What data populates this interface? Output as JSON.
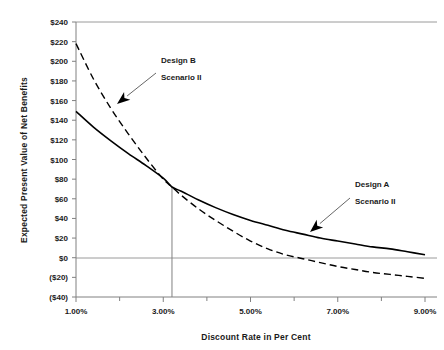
{
  "chart_data": {
    "type": "line",
    "title": "",
    "xlabel": "Discount Rate in Per Cent",
    "ylabel": "Expected Present Value of Net Benefits",
    "xlim": [
      1.0,
      9.0
    ],
    "ylim": [
      -40,
      240
    ],
    "grid": false,
    "legend_position": "none",
    "x_tick_labels": [
      "1.00%",
      "3.00%",
      "5.00%",
      "7.00%",
      "9.00%"
    ],
    "x_tick_values": [
      1.0,
      3.0,
      5.0,
      7.0,
      9.0
    ],
    "x_minor_tick_values": [
      2.0,
      4.0,
      6.0,
      8.0
    ],
    "y_tick_labels": [
      "$240",
      "$220",
      "$200",
      "$180",
      "$160",
      "$140",
      "$120",
      "$100",
      "$80",
      "$60",
      "$40",
      "$20",
      "$0",
      "($20)",
      "($40)"
    ],
    "y_tick_values": [
      240,
      220,
      200,
      180,
      160,
      140,
      120,
      100,
      80,
      60,
      40,
      20,
      0,
      -20,
      -40
    ],
    "zero_line_value": 0,
    "crossover": {
      "x": 3.2,
      "y": 72
    },
    "series": [
      {
        "name": "Design A Scenario II",
        "style": "solid",
        "color": "#000000",
        "x": [
          1.0,
          1.4,
          1.8,
          2.2,
          2.6,
          3.0,
          3.2,
          3.4,
          3.8,
          4.2,
          4.6,
          5.0,
          5.4,
          5.8,
          6.2,
          6.6,
          7.0,
          7.4,
          7.8,
          8.2,
          8.6,
          9.0
        ],
        "values": [
          149,
          133,
          119,
          106,
          94,
          81,
          72,
          68,
          59,
          51,
          44,
          38,
          33,
          28,
          24,
          20,
          17,
          14,
          11,
          9,
          6,
          3
        ]
      },
      {
        "name": "Design B Scenario II",
        "style": "dashed",
        "color": "#000000",
        "x": [
          1.0,
          1.4,
          1.8,
          2.2,
          2.6,
          3.0,
          3.2,
          3.4,
          3.8,
          4.2,
          4.6,
          5.0,
          5.4,
          5.8,
          6.2,
          6.6,
          7.0,
          7.4,
          7.8,
          8.2,
          8.6,
          9.0
        ],
        "values": [
          218,
          182,
          152,
          126,
          102,
          80,
          72,
          64,
          50,
          38,
          27,
          17,
          9,
          3,
          -1,
          -5,
          -9,
          -12,
          -15,
          -17,
          -19,
          -21
        ]
      }
    ],
    "annotations": [
      {
        "id": "design-b",
        "line1": "Design B",
        "line2": "Scenario II",
        "text_x": 161,
        "text_y": 63,
        "arrow_from_x": 156,
        "arrow_from_y": 73,
        "arrow_to_x": 117,
        "arrow_to_y": 104
      },
      {
        "id": "design-a",
        "line1": "Design A",
        "line2": "Scenario II",
        "text_x": 355,
        "text_y": 187,
        "arrow_from_x": 350,
        "arrow_from_y": 198,
        "arrow_to_x": 310,
        "arrow_to_y": 232
      }
    ]
  },
  "colors": {
    "curve": "#000000",
    "axis": "#808080",
    "gridline": "#a6a6a6",
    "text": "#1a1a1a",
    "background": "#ffffff"
  }
}
